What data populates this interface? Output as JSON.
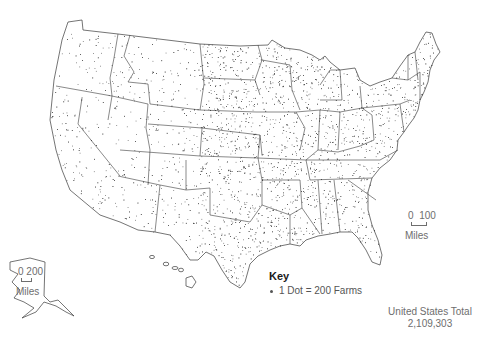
{
  "map": {
    "title": "Farms in the United States (dot density)",
    "total_label": "United States Total",
    "total_value": "2,109,303",
    "key": {
      "title": "Key",
      "item": "1 Dot = 200 Farms",
      "dot_value": 200,
      "unit": "Farms"
    },
    "scale_contiguous": {
      "start": "0",
      "end": "100",
      "unit": "Miles"
    },
    "scale_alaska": {
      "start": "0",
      "end": "200",
      "unit": "Miles"
    },
    "colors": {
      "outline": "#3a3a3a",
      "dot": "#2a2a2a",
      "text": "#6e6e6e",
      "background": "#ffffff"
    },
    "insets": [
      "Alaska",
      "Hawaii"
    ]
  }
}
